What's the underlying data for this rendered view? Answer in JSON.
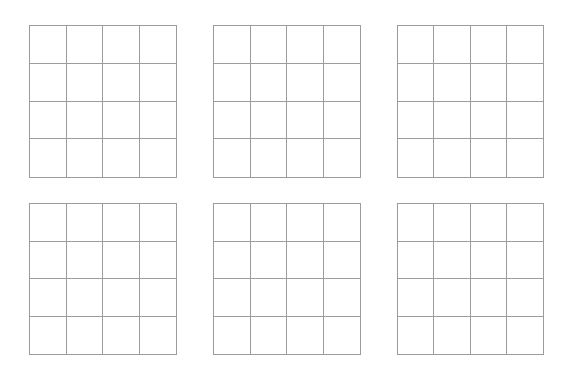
{
  "page": {
    "background": "#ffffff",
    "line_color": "#9c9c9c"
  },
  "layout": {
    "rows": 2,
    "columns": 3
  },
  "boards": [
    {
      "id": "board-1",
      "row": 1,
      "col": 1,
      "x": 29,
      "y": 25,
      "width": 148,
      "height": 153,
      "grid_rows": 4,
      "grid_cols": 4,
      "cells": [
        "",
        "",
        "",
        "",
        "",
        "",
        "",
        "",
        "",
        "",
        "",
        "",
        "",
        "",
        "",
        ""
      ]
    },
    {
      "id": "board-2",
      "row": 1,
      "col": 2,
      "x": 213,
      "y": 25,
      "width": 148,
      "height": 153,
      "grid_rows": 4,
      "grid_cols": 4,
      "cells": [
        "",
        "",
        "",
        "",
        "",
        "",
        "",
        "",
        "",
        "",
        "",
        "",
        "",
        "",
        "",
        ""
      ]
    },
    {
      "id": "board-3",
      "row": 1,
      "col": 3,
      "x": 397,
      "y": 25,
      "width": 147,
      "height": 153,
      "grid_rows": 4,
      "grid_cols": 4,
      "cells": [
        "",
        "",
        "",
        "",
        "",
        "",
        "",
        "",
        "",
        "",
        "",
        "",
        "",
        "",
        "",
        ""
      ]
    },
    {
      "id": "board-4",
      "row": 2,
      "col": 1,
      "x": 29,
      "y": 203,
      "width": 148,
      "height": 152,
      "grid_rows": 4,
      "grid_cols": 4,
      "cells": [
        "",
        "",
        "",
        "",
        "",
        "",
        "",
        "",
        "",
        "",
        "",
        "",
        "",
        "",
        "",
        ""
      ]
    },
    {
      "id": "board-5",
      "row": 2,
      "col": 2,
      "x": 213,
      "y": 203,
      "width": 148,
      "height": 152,
      "grid_rows": 4,
      "grid_cols": 4,
      "cells": [
        "",
        "",
        "",
        "",
        "",
        "",
        "",
        "",
        "",
        "",
        "",
        "",
        "",
        "",
        "",
        ""
      ]
    },
    {
      "id": "board-6",
      "row": 2,
      "col": 3,
      "x": 397,
      "y": 203,
      "width": 147,
      "height": 152,
      "grid_rows": 4,
      "grid_cols": 4,
      "cells": [
        "",
        "",
        "",
        "",
        "",
        "",
        "",
        "",
        "",
        "",
        "",
        "",
        "",
        "",
        "",
        ""
      ]
    }
  ]
}
